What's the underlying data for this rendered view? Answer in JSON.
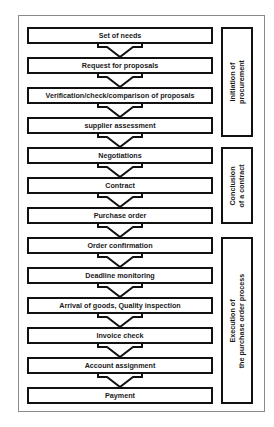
{
  "diagram": {
    "steps": [
      {
        "label": "Set of needs"
      },
      {
        "label": "Request for proposals"
      },
      {
        "label": "Verification/check/comparison of proposals"
      },
      {
        "label": "supplier assessment"
      },
      {
        "label": "Negotiations"
      },
      {
        "label": "Contract"
      },
      {
        "label": "Purchase order"
      },
      {
        "label": "Order confirmation"
      },
      {
        "label": "Deadline monitoring"
      },
      {
        "label": "Arrival of goods, Quality inspection"
      },
      {
        "label": "Invoice check"
      },
      {
        "label": "Account assignment"
      },
      {
        "label": "Payment"
      }
    ],
    "phases": [
      {
        "line1": "Initiation of",
        "line2": "procurement",
        "spans_steps": [
          1,
          4
        ]
      },
      {
        "line1": "Conclusion",
        "line2": "of a contract",
        "spans_steps": [
          5,
          7
        ]
      },
      {
        "line1": "Execution of",
        "line2": "the purchase order process",
        "spans_steps": [
          8,
          13
        ]
      }
    ],
    "colors": {
      "stroke": "#111111",
      "frame": "#8a8a8a",
      "background": "#ffffff"
    }
  }
}
